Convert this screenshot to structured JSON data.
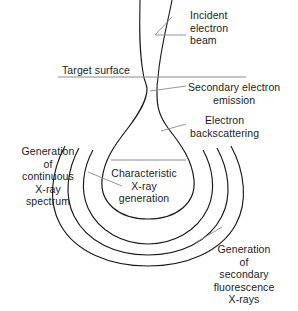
{
  "diagram": {
    "type": "schematic-diagram",
    "canvas": {
      "width": 298,
      "height": 311
    },
    "colors": {
      "background": "#ffffff",
      "stroke": "#1a1a1a",
      "leader_line": "#8a8a8a",
      "text": "#1c1c1c"
    },
    "labels": {
      "incident_beam": "Incident\nelectron\nbeam",
      "target_surface": "Target surface",
      "secondary_emission": "Secondary electron\nemission",
      "electron_backscattering": "Electron\nbackscattering",
      "continuous_spectrum": "Generation\nof\ncontinuous\nX-ray\nspectrum",
      "characteristic_xray": "Characteristic\nX-ray\ngeneration",
      "secondary_fluorescence": "Generation\nof\nsecondary\nfluorescence\nX-rays"
    },
    "regions": [
      {
        "name": "incident-electron-beam",
        "description": "Two converging beam lines entering from top"
      },
      {
        "name": "target-surface-line",
        "description": "Horizontal line marking specimen surface",
        "y": 77
      },
      {
        "name": "interaction-volume-teardrop",
        "description": "Teardrop / pear shaped electron interaction volume"
      },
      {
        "name": "secondary-electron-zone",
        "description": "Narrow neck just below the surface"
      },
      {
        "name": "backscatter-zone",
        "description": "Flaring region below the neck"
      },
      {
        "name": "characteristic-xray-zone",
        "description": "Bulb interior of the teardrop"
      },
      {
        "name": "continuous-xray-arc",
        "description": "First nested arc outside the teardrop"
      },
      {
        "name": "secondary-fluorescence-arc",
        "description": "Outermost nested arc"
      }
    ],
    "arc_count": 3
  }
}
